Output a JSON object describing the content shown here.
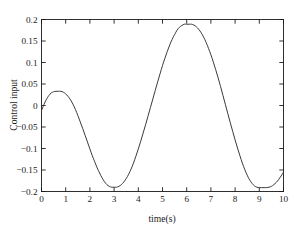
{
  "figure": {
    "background_color": "#ffffff",
    "axes_color": "#1a1a1a",
    "line_color": "#3a3a3a"
  },
  "chart_data": {
    "type": "line",
    "title": "",
    "xlabel": "time(s)",
    "ylabel": "Control input",
    "xlim": [
      0,
      10
    ],
    "ylim": [
      -0.2,
      0.2
    ],
    "xticks": [
      0,
      1,
      2,
      3,
      4,
      5,
      6,
      7,
      8,
      9,
      10
    ],
    "xticklabels": [
      "0",
      "1",
      "2",
      "3",
      "4",
      "5",
      "6",
      "7",
      "8",
      "9",
      "10"
    ],
    "yticks": [
      -0.2,
      -0.15,
      -0.1,
      -0.05,
      0,
      0.05,
      0.1,
      0.15,
      0.2
    ],
    "yticklabels": [
      "-0.2",
      "-0.15",
      "-0.1",
      "-0.05",
      "0",
      "0.05",
      "0.1",
      "0.15",
      "0.2"
    ],
    "grid": false,
    "legend": null,
    "series": [
      {
        "name": "Control input",
        "color": "#3a3a3a",
        "linewidth": 1.0,
        "x": [
          0,
          0.1,
          0.2,
          0.3,
          0.4,
          0.5,
          0.6,
          0.7,
          0.8,
          0.9,
          1.0,
          1.1,
          1.2,
          1.3,
          1.4,
          1.5,
          1.6,
          1.7,
          1.8,
          1.9,
          2.0,
          2.1,
          2.2,
          2.3,
          2.4,
          2.5,
          2.6,
          2.7,
          2.8,
          2.9,
          3.0,
          3.1,
          3.2,
          3.3,
          3.4,
          3.5,
          3.6,
          3.7,
          3.8,
          3.9,
          4.0,
          4.1,
          4.2,
          4.3,
          4.4,
          4.5,
          4.6,
          4.7,
          4.8,
          4.9,
          5.0,
          5.1,
          5.2,
          5.3,
          5.4,
          5.5,
          5.6,
          5.7,
          5.8,
          5.9,
          6.0,
          6.1,
          6.2,
          6.3,
          6.4,
          6.5,
          6.6,
          6.7,
          6.8,
          6.9,
          7.0,
          7.1,
          7.2,
          7.3,
          7.4,
          7.5,
          7.6,
          7.7,
          7.8,
          7.9,
          8.0,
          8.1,
          8.2,
          8.3,
          8.4,
          8.5,
          8.6,
          8.7,
          8.8,
          8.9,
          9.0,
          9.1,
          9.2,
          9.3,
          9.4,
          9.5,
          9.6,
          9.7,
          9.8,
          9.9,
          10.0
        ],
        "y": [
          -0.012,
          0.002,
          0.014,
          0.023,
          0.029,
          0.032,
          0.033,
          0.033,
          0.033,
          0.031,
          0.027,
          0.021,
          0.013,
          0.003,
          -0.009,
          -0.023,
          -0.038,
          -0.053,
          -0.069,
          -0.085,
          -0.101,
          -0.117,
          -0.131,
          -0.145,
          -0.157,
          -0.168,
          -0.177,
          -0.184,
          -0.188,
          -0.19,
          -0.19,
          -0.19,
          -0.188,
          -0.184,
          -0.178,
          -0.17,
          -0.16,
          -0.148,
          -0.134,
          -0.118,
          -0.101,
          -0.083,
          -0.064,
          -0.045,
          -0.025,
          -0.005,
          0.015,
          0.035,
          0.055,
          0.074,
          0.093,
          0.11,
          0.126,
          0.141,
          0.154,
          0.165,
          0.175,
          0.182,
          0.186,
          0.189,
          0.189,
          0.189,
          0.189,
          0.187,
          0.183,
          0.177,
          0.169,
          0.159,
          0.147,
          0.133,
          0.118,
          0.101,
          0.083,
          0.064,
          0.044,
          0.023,
          0.002,
          -0.019,
          -0.04,
          -0.06,
          -0.08,
          -0.099,
          -0.117,
          -0.134,
          -0.149,
          -0.162,
          -0.173,
          -0.181,
          -0.187,
          -0.19,
          -0.191,
          -0.191,
          -0.191,
          -0.191,
          -0.19,
          -0.188,
          -0.184,
          -0.179,
          -0.172,
          -0.164,
          -0.155
        ]
      }
    ],
    "annotations": {
      "local_max_1": {
        "x": 0.8,
        "y": 0.033
      },
      "min_1": {
        "x": 3.05,
        "y": -0.19
      },
      "max_2": {
        "x": 6.2,
        "y": 0.189
      },
      "min_2": {
        "x": 9.4,
        "y": -0.191
      },
      "start": {
        "x": 0,
        "y": -0.012
      },
      "end": {
        "x": 10,
        "y": -0.155
      }
    }
  }
}
